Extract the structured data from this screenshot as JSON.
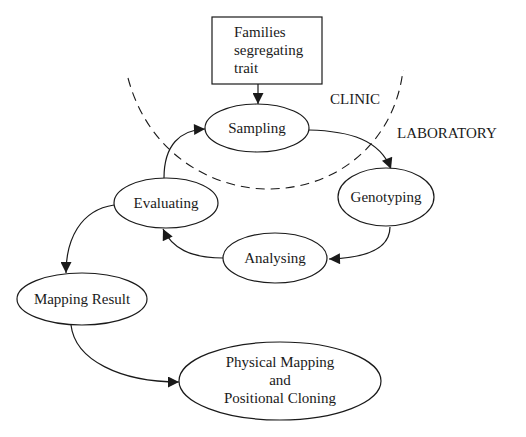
{
  "diagram": {
    "type": "flow-cycle",
    "regions": {
      "clinic": {
        "label": "CLINIC"
      },
      "laboratory": {
        "label": "LABORATORY"
      }
    },
    "nodes": {
      "families": {
        "shape": "rectangle",
        "lines": [
          "Families",
          "segregating",
          "trait"
        ]
      },
      "sampling": {
        "shape": "ellipse",
        "label": "Sampling"
      },
      "genotyping": {
        "shape": "ellipse",
        "label": "Genotyping"
      },
      "analysing": {
        "shape": "ellipse",
        "label": "Analysing"
      },
      "evaluating": {
        "shape": "ellipse",
        "label": "Evaluating"
      },
      "mapping_result": {
        "shape": "ellipse",
        "label": "Mapping Result"
      },
      "physical_mapping": {
        "shape": "ellipse",
        "lines": [
          "Physical Mapping",
          "and",
          "Positional Cloning"
        ]
      }
    },
    "edges": [
      {
        "from": "Families segregating trait",
        "to": "Sampling"
      },
      {
        "from": "Sampling",
        "to": "Genotyping"
      },
      {
        "from": "Genotyping",
        "to": "Analysing"
      },
      {
        "from": "Analysing",
        "to": "Evaluating"
      },
      {
        "from": "Evaluating",
        "to": "Sampling"
      },
      {
        "from": "Evaluating",
        "to": "Mapping Result"
      },
      {
        "from": "Mapping Result",
        "to": "Physical Mapping and Positional Cloning"
      }
    ],
    "colors": {
      "stroke": "#1a1a1a",
      "background": "#ffffff"
    }
  }
}
